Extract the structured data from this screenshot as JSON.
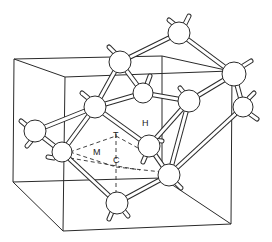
{
  "diagram": {
    "type": "crystal-lattice-cube",
    "labels": {
      "H": "H",
      "T": "T",
      "M": "M",
      "C": "C"
    },
    "colors": {
      "line": "#2a2a2a",
      "fill": "#ffffff"
    }
  }
}
